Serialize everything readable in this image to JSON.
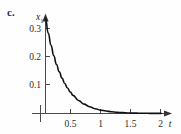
{
  "figure": {
    "part_label": "c."
  },
  "chart_data": {
    "type": "line",
    "title": "",
    "subtitle": "",
    "xlabel": "t",
    "ylabel": "x1",
    "ylabel_base": "x",
    "ylabel_subscript": "1",
    "xlim": [
      0,
      2.12
    ],
    "ylim": [
      0,
      0.36
    ],
    "grid": false,
    "legend": null,
    "xticks": [
      0.5,
      1,
      1.5,
      2
    ],
    "xtick_labels": [
      "0.5",
      "1",
      "1.5",
      "2"
    ],
    "yticks": [
      0.1,
      0.2,
      0.3
    ],
    "ytick_labels": [
      "0.1",
      "0.2",
      "0.3"
    ],
    "series": [
      {
        "name": "x1(t)",
        "description": "exponential decay",
        "color": "#111111",
        "x": [
          0,
          0.05,
          0.1,
          0.15,
          0.2,
          0.25,
          0.3,
          0.35,
          0.4,
          0.45,
          0.5,
          0.6,
          0.7,
          0.8,
          0.9,
          1.0,
          1.1,
          1.2,
          1.3,
          1.4,
          1.5,
          1.6,
          1.7,
          1.8,
          1.9,
          2.0,
          2.1
        ],
        "values": [
          0.335,
          0.284,
          0.241,
          0.204,
          0.173,
          0.147,
          0.125,
          0.106,
          0.09,
          0.076,
          0.064,
          0.046,
          0.033,
          0.024,
          0.017,
          0.012,
          0.009,
          0.006,
          0.004,
          0.003,
          0.002,
          0.0015,
          0.001,
          0.0008,
          0.0005,
          0.0004,
          0.0003
        ]
      }
    ],
    "colors": {
      "axis": "#4a4a4a",
      "curve": "#111111",
      "label_accent": "#1b2a5e",
      "background": "#fefefe"
    }
  }
}
